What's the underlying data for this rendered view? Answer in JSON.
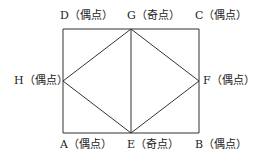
{
  "diagram": {
    "type": "graph",
    "line_color": "#333333",
    "nodes": [
      {
        "id": "A",
        "label": "A（偶点）",
        "x": 63,
        "y": 133
      },
      {
        "id": "B",
        "label": "B（偶点）",
        "x": 199,
        "y": 133
      },
      {
        "id": "C",
        "label": "C（偶点）",
        "x": 199,
        "y": 29
      },
      {
        "id": "D",
        "label": "D（偶点）",
        "x": 63,
        "y": 29
      },
      {
        "id": "E",
        "label": "E（奇点）",
        "x": 131,
        "y": 133
      },
      {
        "id": "F",
        "label": "F（偶点）",
        "x": 199,
        "y": 81
      },
      {
        "id": "G",
        "label": "G（奇点）",
        "x": 131,
        "y": 29
      },
      {
        "id": "H",
        "label": "H（偶点）",
        "x": 63,
        "y": 81
      }
    ],
    "edges": [
      [
        "A",
        "E"
      ],
      [
        "E",
        "B"
      ],
      [
        "B",
        "F"
      ],
      [
        "F",
        "C"
      ],
      [
        "C",
        "G"
      ],
      [
        "G",
        "D"
      ],
      [
        "D",
        "H"
      ],
      [
        "H",
        "A"
      ],
      [
        "G",
        "E"
      ],
      [
        "G",
        "H"
      ],
      [
        "H",
        "E"
      ],
      [
        "G",
        "F"
      ],
      [
        "F",
        "E"
      ]
    ]
  }
}
